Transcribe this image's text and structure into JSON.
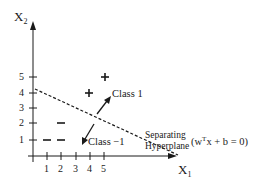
{
  "diagram": {
    "type": "svm-separating-hyperplane",
    "y_axis": {
      "name": "X",
      "subscript": "2",
      "ticks": [
        "1",
        "2",
        "3",
        "4",
        "5"
      ]
    },
    "x_axis": {
      "name": "X",
      "subscript": "1",
      "ticks": [
        "1",
        "2",
        "3",
        "4",
        "5"
      ]
    },
    "points": {
      "positive": {
        "symbol": "+",
        "coords": [
          [
            5,
            5
          ],
          [
            4,
            4
          ]
        ]
      },
      "negative": {
        "symbol": "−",
        "coords": [
          [
            2,
            2
          ],
          [
            1,
            1
          ],
          [
            2,
            1
          ]
        ]
      }
    },
    "labels": {
      "class_positive": "Class 1",
      "class_negative": "Class −1",
      "hyperplane_line1": "Separating",
      "hyperplane_line2": "Hyperplane",
      "equation_pre": "(w",
      "equation_sup": "T",
      "equation_post": "x + b = 0)"
    },
    "colors": {
      "ink": "#1a1a1a",
      "background": "#ffffff"
    }
  }
}
